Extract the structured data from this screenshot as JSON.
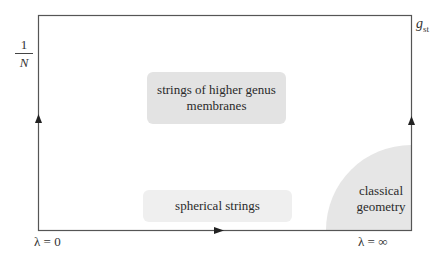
{
  "axes": {
    "y_left_label_numerator": "1",
    "y_left_label_denominator": "N",
    "y_right_label_base": "g",
    "y_right_label_sub": "st",
    "x_left_label": "λ = 0",
    "x_right_label": "λ = ∞"
  },
  "regions": {
    "higher_genus_line1": "strings of higher genus",
    "higher_genus_line2": "membranes",
    "spherical": "spherical strings",
    "classical_line1": "classical",
    "classical_line2": "geometry"
  },
  "colors": {
    "frame": "#555555",
    "region_fill": "#e3e3e3",
    "region_fill_light": "#efefef",
    "text": "#2a2a2a"
  }
}
